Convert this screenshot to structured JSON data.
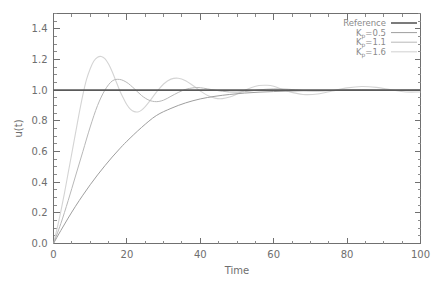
{
  "chart_data": {
    "type": "line",
    "title": "",
    "xlabel": "Time",
    "ylabel": "u(t)",
    "xlim": [
      0,
      100
    ],
    "ylim": [
      0.0,
      1.5
    ],
    "grid": false,
    "legend_position": "upper-right-inside",
    "xticks": [
      0,
      20,
      40,
      60,
      80,
      100
    ],
    "xtick_labels": [
      "0",
      "20",
      "40",
      "60",
      "80",
      "100"
    ],
    "xminor_step": 5,
    "yticks": [
      0.0,
      0.2,
      0.4,
      0.6,
      0.8,
      1.0,
      1.2,
      1.4
    ],
    "ytick_labels": [
      "0.0",
      "0.2",
      "0.4",
      "0.6",
      "0.8",
      "1.0",
      "1.2",
      "1.4"
    ],
    "yminor_step": 0.05,
    "series": [
      {
        "name": "Reference",
        "legend_label": "Reference",
        "color": "#5a5a5a",
        "width": 1.6,
        "x": [
          0,
          100
        ],
        "values": [
          1.0,
          1.0
        ]
      },
      {
        "name": "Kp=0.5",
        "legend_label": "K",
        "legend_sub": "p",
        "legend_rest": "=0.5",
        "color": "#9e9e9e",
        "width": 1.0,
        "x": [
          0,
          2,
          4,
          6,
          8,
          10,
          12,
          14,
          16,
          18,
          20,
          24,
          28,
          32,
          36,
          40,
          44,
          48,
          52,
          56,
          60,
          64,
          68,
          72,
          76,
          80,
          84,
          88,
          92,
          96,
          100
        ],
        "values": [
          0.0,
          0.085,
          0.166,
          0.243,
          0.315,
          0.383,
          0.447,
          0.507,
          0.564,
          0.617,
          0.667,
          0.757,
          0.834,
          0.881,
          0.917,
          0.943,
          0.96,
          0.972,
          0.981,
          0.987,
          0.991,
          0.994,
          0.996,
          0.997,
          0.998,
          0.999,
          0.999,
          1.0,
          1.0,
          1.0,
          1.0
        ]
      },
      {
        "name": "Kp=1.1",
        "legend_label": "K",
        "legend_sub": "p",
        "legend_rest": "=1.1",
        "color": "#b8b8b8",
        "width": 1.0,
        "x": [
          0,
          2,
          4,
          6,
          8,
          10,
          12,
          14,
          16,
          18,
          20,
          22,
          24,
          26,
          28,
          30,
          32,
          34,
          36,
          38,
          40,
          44,
          48,
          52,
          56,
          60,
          64,
          68,
          72,
          76,
          80,
          84,
          88,
          92,
          96,
          100
        ],
        "values": [
          0.0,
          0.13,
          0.28,
          0.44,
          0.6,
          0.76,
          0.9,
          1.0,
          1.06,
          1.07,
          1.05,
          1.01,
          0.965,
          0.935,
          0.925,
          0.935,
          0.96,
          0.985,
          1.005,
          1.015,
          1.016,
          1.0,
          0.988,
          0.99,
          1.002,
          1.008,
          1.006,
          0.998,
          0.995,
          0.998,
          1.003,
          1.004,
          1.001,
          0.998,
          0.999,
          1.001
        ]
      },
      {
        "name": "Kp=1.6",
        "legend_label": "K",
        "legend_sub": "p",
        "legend_rest": "=1.6",
        "color": "#d4d4d4",
        "width": 1.1,
        "x": [
          0,
          1,
          2,
          3,
          4,
          5,
          6,
          7,
          8,
          9,
          10,
          11,
          12,
          13,
          14,
          15,
          16,
          17,
          18,
          19,
          20,
          21,
          22,
          23,
          24,
          25,
          26,
          28,
          30,
          32,
          34,
          36,
          38,
          40,
          42,
          44,
          46,
          48,
          50,
          52,
          54,
          56,
          58,
          60,
          64,
          68,
          72,
          76,
          80,
          84,
          88,
          92,
          96,
          100
        ],
        "values": [
          0.0,
          0.1,
          0.21,
          0.33,
          0.46,
          0.59,
          0.72,
          0.85,
          0.97,
          1.07,
          1.14,
          1.19,
          1.215,
          1.22,
          1.205,
          1.17,
          1.12,
          1.06,
          1.0,
          0.95,
          0.905,
          0.875,
          0.86,
          0.858,
          0.87,
          0.893,
          0.922,
          0.985,
          1.04,
          1.072,
          1.078,
          1.062,
          1.03,
          0.995,
          0.965,
          0.948,
          0.945,
          0.955,
          0.975,
          0.998,
          1.018,
          1.03,
          1.032,
          1.025,
          0.992,
          0.972,
          0.975,
          0.995,
          1.015,
          1.024,
          1.018,
          1.002,
          0.988,
          0.988
        ]
      }
    ]
  },
  "legend": {
    "entries": [
      {
        "label": "Reference",
        "sub": "",
        "rest": ""
      },
      {
        "label": "K",
        "sub": "p",
        "rest": "=0.5"
      },
      {
        "label": "K",
        "sub": "p",
        "rest": "=1.1"
      },
      {
        "label": "K",
        "sub": "p",
        "rest": "=1.6"
      }
    ]
  }
}
